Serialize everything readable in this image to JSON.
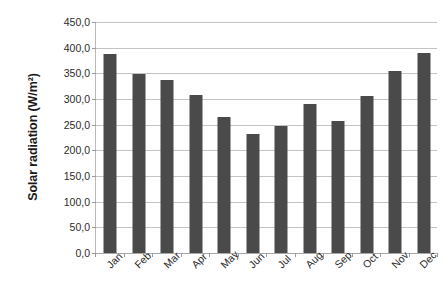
{
  "chart_data": {
    "type": "bar",
    "title": "",
    "xlabel": "",
    "ylabel": "Solar radiation (W/m²)",
    "categories": [
      "Jan",
      "Feb",
      "Mar",
      "Apr",
      "May",
      "Jun",
      "Jul",
      "Aug",
      "Sep",
      "Oct",
      "Nov",
      "Dec"
    ],
    "values": [
      387.0,
      349.0,
      338.0,
      308.0,
      264.0,
      231.0,
      248.0,
      290.0,
      257.0,
      306.0,
      354.0,
      390.0
    ],
    "ylim": [
      0,
      450
    ],
    "ytick_step": 50,
    "ytick_values": [
      0,
      50,
      100,
      150,
      200,
      250,
      300,
      350,
      400,
      450
    ],
    "ytick_labels": [
      "0,0",
      "50,0",
      "100,0",
      "150,0",
      "200,0",
      "250,0",
      "300,0",
      "350,0",
      "400,0",
      "450,0"
    ],
    "grid": true,
    "legend": false,
    "legend_position": "none",
    "bar_color": "#4a4a4a",
    "gridline_color": "#c3c3c3",
    "axis_color": "#b9b9b9",
    "background_color": "#ffffff",
    "xtick_label_rotation": -45
  }
}
